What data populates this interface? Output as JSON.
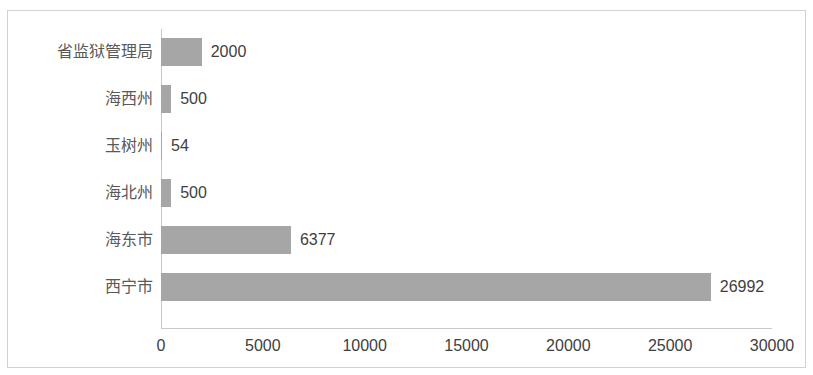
{
  "chart_data": {
    "type": "bar",
    "orientation": "horizontal",
    "title": "",
    "xlabel": "",
    "ylabel": "",
    "categories": [
      "省监狱管理局",
      "海西州",
      "玉树州",
      "海北州",
      "海东市",
      "西宁市"
    ],
    "values": [
      2000,
      500,
      54,
      500,
      6377,
      26992
    ],
    "data_labels": [
      "2000",
      "500",
      "54",
      "500",
      "6377",
      "26992"
    ],
    "xlim": [
      0,
      30000
    ],
    "xticks": [
      0,
      5000,
      10000,
      15000,
      20000,
      25000,
      30000
    ],
    "xtick_labels": [
      "0",
      "5000",
      "10000",
      "15000",
      "20000",
      "25000",
      "30000"
    ],
    "grid": false,
    "legend": null,
    "series": [
      {
        "name": "",
        "values": [
          2000,
          500,
          54,
          500,
          6377,
          26992
        ]
      }
    ],
    "colors": {
      "bar": "#a6a6a6",
      "axis": "#c8c8c8",
      "tick_text": "#404040",
      "category_text": "#595959",
      "frame_border": "#d2d2d2",
      "background": "#ffffff"
    }
  }
}
